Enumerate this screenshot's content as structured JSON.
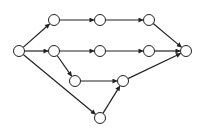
{
  "diagram": {
    "type": "directed-graph",
    "node_radius": 5.5,
    "colors": {
      "stroke": "#222222",
      "fill": "#ffffff",
      "background": "#ffffff"
    },
    "nodes": [
      {
        "id": "n0",
        "x": 19,
        "y": 51
      },
      {
        "id": "n1",
        "x": 54,
        "y": 20
      },
      {
        "id": "n2",
        "x": 100,
        "y": 20
      },
      {
        "id": "n3",
        "x": 149,
        "y": 20
      },
      {
        "id": "n4",
        "x": 54,
        "y": 51
      },
      {
        "id": "n5",
        "x": 100,
        "y": 51
      },
      {
        "id": "n6",
        "x": 149,
        "y": 51
      },
      {
        "id": "n7",
        "x": 186,
        "y": 51
      },
      {
        "id": "n8",
        "x": 75,
        "y": 81
      },
      {
        "id": "n9",
        "x": 123,
        "y": 81
      },
      {
        "id": "n10",
        "x": 100,
        "y": 118
      }
    ],
    "edges": [
      {
        "from": "n0",
        "to": "n1"
      },
      {
        "from": "n0",
        "to": "n4"
      },
      {
        "from": "n0",
        "to": "n10"
      },
      {
        "from": "n1",
        "to": "n2"
      },
      {
        "from": "n2",
        "to": "n3"
      },
      {
        "from": "n3",
        "to": "n7"
      },
      {
        "from": "n4",
        "to": "n5"
      },
      {
        "from": "n4",
        "to": "n8"
      },
      {
        "from": "n5",
        "to": "n6"
      },
      {
        "from": "n6",
        "to": "n7"
      },
      {
        "from": "n8",
        "to": "n9"
      },
      {
        "from": "n10",
        "to": "n9"
      },
      {
        "from": "n9",
        "to": "n7"
      }
    ]
  }
}
